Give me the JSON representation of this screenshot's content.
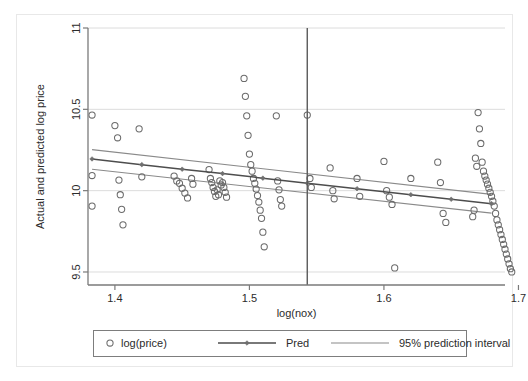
{
  "chart_data": {
    "type": "scatter",
    "title": "",
    "subtitle": "",
    "xlabel": "log(nox)",
    "ylabel": "Actual and predicted log price",
    "xlim": [
      1.38,
      1.69
    ],
    "ylim": [
      9.42,
      11.0
    ],
    "xticks": [
      1.4,
      1.5,
      1.6,
      1.7
    ],
    "xtick_labels": [
      "1.4",
      "1.5",
      "1.6",
      "1.7"
    ],
    "yticks": [
      9.5,
      10,
      10.5,
      11
    ],
    "ytick_labels": [
      "9.5",
      "10",
      "10.5",
      "11"
    ],
    "grid": "horizontal-only",
    "legend_position": "below-axis",
    "legend": [
      {
        "label": "log(price)",
        "marker": "open-circle",
        "color": "#6b6b6b"
      },
      {
        "label": "Pred",
        "marker": "line-with-diamond",
        "color": "#555555"
      },
      {
        "label": "95% prediction interval",
        "marker": "line",
        "color": "#8a8a8a"
      }
    ],
    "annotations": [
      {
        "type": "vertical-reference-line",
        "x": 1.543,
        "color": "#5a5a5a"
      }
    ],
    "series": [
      {
        "name": "log(price)",
        "type": "scatter",
        "marker": "open-circle",
        "points": [
          [
            1.383,
            10.465
          ],
          [
            1.383,
            10.093
          ],
          [
            1.383,
            9.905
          ],
          [
            1.4,
            10.4
          ],
          [
            1.402,
            10.325
          ],
          [
            1.403,
            10.065
          ],
          [
            1.404,
            9.975
          ],
          [
            1.405,
            9.885
          ],
          [
            1.406,
            9.79
          ],
          [
            1.418,
            10.38
          ],
          [
            1.42,
            10.085
          ],
          [
            1.444,
            10.09
          ],
          [
            1.446,
            10.06
          ],
          [
            1.448,
            10.045
          ],
          [
            1.45,
            10.015
          ],
          [
            1.452,
            9.985
          ],
          [
            1.454,
            9.955
          ],
          [
            1.457,
            10.075
          ],
          [
            1.458,
            10.04
          ],
          [
            1.47,
            10.13
          ],
          [
            1.471,
            10.075
          ],
          [
            1.472,
            10.05
          ],
          [
            1.473,
            10.02
          ],
          [
            1.474,
            9.995
          ],
          [
            1.475,
            9.965
          ],
          [
            1.476,
            10.005
          ],
          [
            1.477,
            9.975
          ],
          [
            1.478,
            10.06
          ],
          [
            1.479,
            10.035
          ],
          [
            1.48,
            10.05
          ],
          [
            1.481,
            10.02
          ],
          [
            1.482,
            9.99
          ],
          [
            1.483,
            9.96
          ],
          [
            1.496,
            10.69
          ],
          [
            1.497,
            10.58
          ],
          [
            1.498,
            10.46
          ],
          [
            1.499,
            10.34
          ],
          [
            1.5,
            10.225
          ],
          [
            1.501,
            10.16
          ],
          [
            1.502,
            10.12
          ],
          [
            1.503,
            10.075
          ],
          [
            1.504,
            10.045
          ],
          [
            1.505,
            10.01
          ],
          [
            1.506,
            9.97
          ],
          [
            1.507,
            9.93
          ],
          [
            1.508,
            9.88
          ],
          [
            1.509,
            9.83
          ],
          [
            1.51,
            9.745
          ],
          [
            1.511,
            9.655
          ],
          [
            1.52,
            10.46
          ],
          [
            1.521,
            10.06
          ],
          [
            1.522,
            10.005
          ],
          [
            1.523,
            9.945
          ],
          [
            1.524,
            9.905
          ],
          [
            1.543,
            10.465
          ],
          [
            1.545,
            10.075
          ],
          [
            1.546,
            10.02
          ],
          [
            1.56,
            10.14
          ],
          [
            1.562,
            10.0
          ],
          [
            1.563,
            9.95
          ],
          [
            1.58,
            10.075
          ],
          [
            1.582,
            9.965
          ],
          [
            1.6,
            10.18
          ],
          [
            1.602,
            10.0
          ],
          [
            1.604,
            9.96
          ],
          [
            1.606,
            9.915
          ],
          [
            1.608,
            9.525
          ],
          [
            1.62,
            10.075
          ],
          [
            1.64,
            10.175
          ],
          [
            1.642,
            10.05
          ],
          [
            1.644,
            9.86
          ],
          [
            1.646,
            9.805
          ],
          [
            1.67,
            10.48
          ],
          [
            1.671,
            10.38
          ],
          [
            1.672,
            10.29
          ],
          [
            1.673,
            10.175
          ],
          [
            1.674,
            10.12
          ],
          [
            1.675,
            10.09
          ],
          [
            1.676,
            10.065
          ],
          [
            1.677,
            10.04
          ],
          [
            1.678,
            10.015
          ],
          [
            1.679,
            9.99
          ],
          [
            1.68,
            9.965
          ],
          [
            1.681,
            9.935
          ],
          [
            1.682,
            9.905
          ],
          [
            1.683,
            9.86
          ],
          [
            1.684,
            9.82
          ],
          [
            1.685,
            9.79
          ],
          [
            1.686,
            9.76
          ],
          [
            1.687,
            9.73
          ],
          [
            1.688,
            9.7
          ],
          [
            1.689,
            9.67
          ],
          [
            1.69,
            9.64
          ],
          [
            1.691,
            9.61
          ],
          [
            1.692,
            9.58
          ],
          [
            1.693,
            9.55
          ],
          [
            1.694,
            9.52
          ],
          [
            1.695,
            9.5
          ],
          [
            1.668,
            10.2
          ],
          [
            1.669,
            10.15
          ],
          [
            1.667,
            9.88
          ],
          [
            1.666,
            9.84
          ]
        ]
      },
      {
        "name": "Pred",
        "type": "line",
        "marker": "diamond",
        "x": [
          1.383,
          1.42,
          1.45,
          1.48,
          1.51,
          1.543,
          1.58,
          1.62,
          1.65,
          1.68
        ],
        "y": [
          10.195,
          10.16,
          10.132,
          10.105,
          10.077,
          10.046,
          10.012,
          9.975,
          9.947,
          9.92
        ]
      },
      {
        "name": "95% prediction interval (upper)",
        "type": "line",
        "x": [
          1.383,
          1.68
        ],
        "y": [
          10.252,
          9.977
        ]
      },
      {
        "name": "95% prediction interval (lower)",
        "type": "line",
        "x": [
          1.383,
          1.68
        ],
        "y": [
          10.132,
          9.862
        ]
      }
    ]
  }
}
